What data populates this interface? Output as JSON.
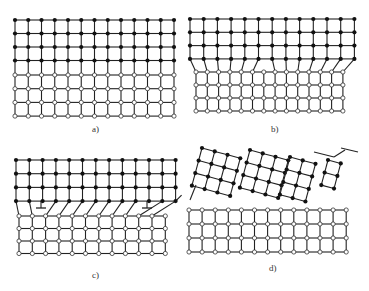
{
  "figure": {
    "colors": {
      "line": "#222222",
      "filled_node": "#111111",
      "open_node_fill": "#ffffff",
      "open_node_stroke": "#333333"
    },
    "panels": [
      {
        "id": "a",
        "label": "a)",
        "type": "coherent",
        "upper_lattice": {
          "x0": 15,
          "y0": 20,
          "cols": 13,
          "rows": 4,
          "dx": 13.25,
          "dy": 13.5,
          "node": "filled"
        },
        "lower_lattice": {
          "x0": 15,
          "y0": 75,
          "cols": 13,
          "rows": 4,
          "dx": 13.25,
          "dy": 13.7,
          "node": "open"
        },
        "label_pos": [
          92,
          131
        ]
      },
      {
        "id": "b",
        "label": "b)",
        "type": "semi-coherent (strained)",
        "upper_lattice": {
          "x0": 190,
          "y0": 19,
          "cols": 13,
          "rows": 4,
          "dx": 13.7,
          "dy": 13.3,
          "node": "filled"
        },
        "lower_lattice": {
          "x0": 196,
          "y0": 72,
          "cols": 14,
          "rows": 4,
          "dx": 11.3,
          "dy": 13.0,
          "node": "open"
        },
        "label_pos": [
          271,
          131
        ]
      },
      {
        "id": "c",
        "label": "c)",
        "type": "semi-coherent with dislocations",
        "upper_lattice": {
          "x0": 16,
          "y0": 160,
          "cols": 13,
          "rows": 4,
          "dx": 13.3,
          "dy": 13.7,
          "node": "filled"
        },
        "lower_lattice": {
          "x0": 19,
          "y0": 216,
          "cols": 12,
          "rows": 4,
          "dx": 13.3,
          "dy": 12.5,
          "node": "open"
        },
        "dislocations": [
          {
            "x": 41,
            "y": 208
          },
          {
            "x": 147,
            "y": 208
          }
        ],
        "label_pos": [
          92,
          277
        ]
      },
      {
        "id": "d",
        "label": "d)",
        "type": "incoherent",
        "upper_lattice": {
          "x0": 203,
          "y0": 148,
          "cols": 12,
          "rows": 5,
          "dx": 13.2,
          "dy": 13.0,
          "node": "filled",
          "rotation_deg": 15
        },
        "lower_lattice": {
          "x0": 189,
          "y0": 210,
          "cols": 13,
          "rows": 4,
          "dx": 13.1,
          "dy": 14.0,
          "node": "open"
        },
        "label_pos": [
          269,
          270
        ]
      }
    ]
  }
}
